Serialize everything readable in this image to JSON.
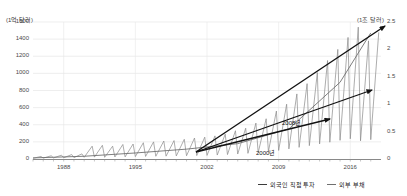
{
  "chart_data": {
    "type": "line",
    "title": "",
    "subtitle": "",
    "xlabel": "",
    "ylabel": "(1억 달러)",
    "y2label": "(1조 달러)",
    "xlim": [
      1985,
      2019
    ],
    "ylim": [
      0,
      1600
    ],
    "y2lim": [
      0,
      2.5
    ],
    "grid": true,
    "legend_position": "bottom-right",
    "x_ticks": [
      "1988",
      "1995",
      "2002",
      "2009",
      "2016"
    ],
    "x_tick_values": [
      1988,
      1995,
      2002,
      2009,
      2016
    ],
    "y_ticks": [
      "0",
      "200",
      "400",
      "600",
      "800",
      "1000",
      "1200",
      "1400",
      "1600"
    ],
    "y_tick_values": [
      0,
      200,
      400,
      600,
      800,
      1000,
      1200,
      1400,
      1600
    ],
    "y2_ticks": [
      "0",
      "0.5",
      "1",
      "1.5",
      "2",
      "2.5"
    ],
    "y2_tick_values": [
      0,
      0.5,
      1,
      1.5,
      2,
      2.5
    ],
    "series": [
      {
        "name": "외국인 직접 투자",
        "axis": "left",
        "color": "#8a8a8a",
        "style": "sawtooth-quarterly",
        "x": [
          1985,
          1986,
          1987,
          1988,
          1989,
          1990,
          1991,
          1992,
          1993,
          1994,
          1995,
          1996,
          1997,
          1998,
          1999,
          2000,
          2001,
          2002,
          2003,
          2004,
          2005,
          2006,
          2007,
          2008,
          2009,
          2010,
          2011,
          2012,
          2013,
          2014,
          2015,
          2016,
          2017,
          2018
        ],
        "peaks": [
          30,
          38,
          45,
          52,
          60,
          150,
          160,
          150,
          170,
          175,
          190,
          200,
          210,
          215,
          230,
          245,
          255,
          270,
          290,
          330,
          360,
          420,
          470,
          560,
          640,
          760,
          880,
          1010,
          1150,
          1280,
          1420,
          1540,
          1380,
          1480
        ],
        "troughs": [
          8,
          10,
          12,
          14,
          16,
          20,
          22,
          20,
          24,
          25,
          28,
          30,
          32,
          33,
          36,
          38,
          40,
          42,
          46,
          52,
          58,
          66,
          74,
          88,
          100,
          118,
          136,
          156,
          176,
          196,
          218,
          236,
          212,
          226
        ]
      },
      {
        "name": "외부 부채",
        "axis": "right",
        "color": "#6f6f6f",
        "style": "line",
        "x": [
          1985,
          1990,
          1995,
          2000,
          2005,
          2010,
          2015,
          2018
        ],
        "values": [
          0.02,
          0.05,
          0.11,
          0.18,
          0.28,
          0.55,
          1.4,
          2.3
        ]
      }
    ],
    "annotations": [
      {
        "label": "2000년",
        "x_px": 256,
        "y_px": 148
      },
      {
        "label": "2008년",
        "x_px": 282,
        "y_px": 118
      }
    ],
    "arrows": [
      {
        "name": "steep-growth-arrow",
        "x1": 196,
        "y1": 152,
        "x2": 385,
        "y2": 26
      },
      {
        "name": "medium-growth-arrow",
        "x1": 196,
        "y1": 152,
        "x2": 372,
        "y2": 90
      },
      {
        "name": "shallow-growth-arrow",
        "x1": 196,
        "y1": 152,
        "x2": 330,
        "y2": 119
      }
    ]
  },
  "legend": {
    "items": [
      {
        "label": "외국인 직접 투자",
        "color": "#3b3b3b"
      },
      {
        "label": "외부 부채",
        "color": "#6f6f6f"
      }
    ]
  },
  "axes": {
    "left_unit": "(1억 달러)",
    "right_unit": "(1조 달러)"
  }
}
